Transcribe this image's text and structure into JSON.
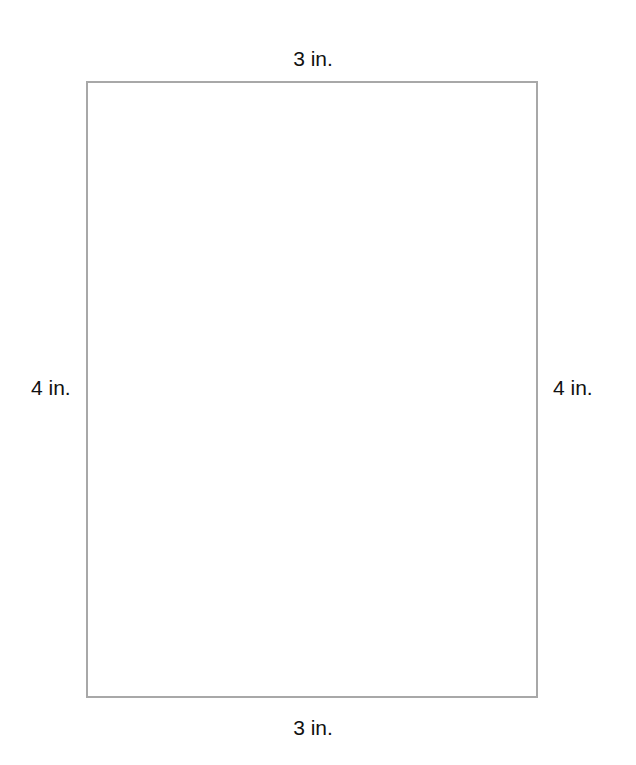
{
  "diagram": {
    "shape": "rectangle",
    "border_color": "#a8a8a8",
    "labels": {
      "top": "3 in.",
      "bottom": "3 in.",
      "left": "4 in.",
      "right": "4 in."
    }
  }
}
